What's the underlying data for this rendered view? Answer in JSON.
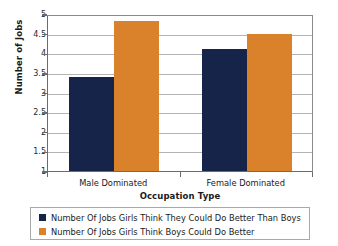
{
  "chart_data": {
    "type": "bar",
    "title": "",
    "xlabel": "Occupation Type",
    "ylabel": "Number of Jobs",
    "categories": [
      "Male Dominated",
      "Female Dominated"
    ],
    "series": [
      {
        "name": "Number Of Jobs Girls Think They Could Do Better Than Boys",
        "color": "#17244a",
        "values": [
          3.4,
          4.1
        ]
      },
      {
        "name": "Number Of Jobs Girls Think Boys Could Do Better",
        "color": "#d9822b",
        "values": [
          4.83,
          4.5
        ]
      }
    ],
    "ylim": [
      1,
      5
    ],
    "ytick_labels": [
      "5",
      "4.5",
      "4",
      "3.5",
      "3",
      "2.5",
      "2",
      "1.5",
      "1"
    ],
    "ytick_values": [
      5,
      4.5,
      4,
      3.5,
      3,
      2.5,
      2,
      1.5,
      1
    ],
    "grid": true,
    "legend_position": "bottom"
  },
  "axis": {
    "y_title": "Number of Jobs",
    "x_title": "Occupation Type"
  },
  "legend": {
    "entries": [
      {
        "label": "Number Of Jobs Girls Think They Could Do Better Than Boys",
        "swatch": "navy"
      },
      {
        "label": "Number Of Jobs Girls Think Boys Could Do Better",
        "swatch": "orange"
      }
    ]
  }
}
